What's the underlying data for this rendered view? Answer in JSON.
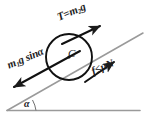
{
  "diagram": {
    "background_color": "#ffffff",
    "stroke_color": "#1b1b1b",
    "incline_color": "#9a9a9a",
    "labels": {
      "tension_prefix": "T",
      "tension_equals": "=",
      "tension_mass": "m",
      "tension_mass_sub": "2",
      "tension_gravity": "g",
      "gravity_mass": "m",
      "gravity_mass_sub": "1",
      "gravity_rest": "g sin",
      "gravity_angle": "α",
      "friction_force": "f",
      "friction_relation": "≤",
      "friction_mu": "μ",
      "friction_normal": "N",
      "center_point": "C",
      "incline_angle": "α"
    },
    "geometry": {
      "circle_center_x": 69,
      "circle_center_y": 57,
      "circle_radius": 23,
      "incline_angle_degrees": 23,
      "baseline_y": 110
    }
  }
}
